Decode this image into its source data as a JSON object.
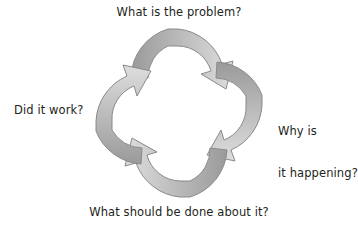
{
  "diagram": {
    "title_text": "",
    "type": "cyclical-four-step-arrow-diagram",
    "background_color": "#ffffff",
    "text_color": "#231f20",
    "arrow_dark_color": "#9a9a9a",
    "arrow_light_color": "#dcdcdc",
    "arrow_outline_color": "#8a8a8a",
    "rotation_direction": "clockwise",
    "labels": {
      "top": "What is the problem?",
      "right_line1": "Why is",
      "right_line2": "it happening?",
      "bottom": "What should be done about it?",
      "left": "Did it work?"
    },
    "steps": [
      {
        "position": "top",
        "text": "What is the problem?",
        "arrow_name": "arrow-top",
        "points_to": "right"
      },
      {
        "position": "right",
        "text": "Why is it happening?",
        "arrow_name": "arrow-right",
        "points_to": "bottom"
      },
      {
        "position": "bottom",
        "text": "What should be done about it?",
        "arrow_name": "arrow-bottom",
        "points_to": "left"
      },
      {
        "position": "left",
        "text": "Did it work?",
        "arrow_name": "arrow-left",
        "points_to": "top"
      }
    ]
  }
}
